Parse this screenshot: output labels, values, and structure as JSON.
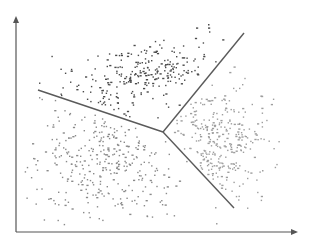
{
  "diagram": {
    "type": "voronoi-cluster-partition",
    "axes": {
      "x_label": "",
      "y_label": "",
      "arrows": true
    },
    "colors": {
      "axis": "#555555",
      "boundary": "#5a5a5a",
      "cluster_top": "#4a4a4a",
      "cluster_left": "#8a8a8a",
      "cluster_right": "#9e9e9e",
      "background": "#ffffff"
    },
    "clusters": [
      {
        "name": "top",
        "approx_points": 260,
        "shade": "dark"
      },
      {
        "name": "lower-left",
        "approx_points": 330,
        "shade": "medium"
      },
      {
        "name": "right",
        "approx_points": 300,
        "shade": "light"
      }
    ],
    "boundaries": [
      {
        "name": "boundary-left",
        "between": [
          "top",
          "lower-left"
        ]
      },
      {
        "name": "boundary-upper-right",
        "between": [
          "top",
          "right"
        ]
      },
      {
        "name": "boundary-lower",
        "between": [
          "lower-left",
          "right"
        ]
      }
    ]
  }
}
